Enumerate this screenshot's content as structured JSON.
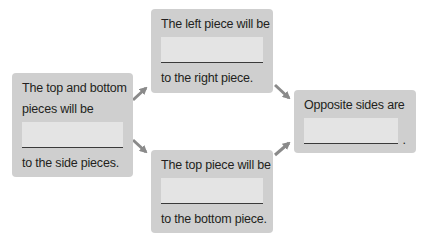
{
  "diagram": {
    "colors": {
      "box_fill": "#cfcfcf",
      "blank_fill": "#e4e4e4",
      "arrow": "#8a8a8a",
      "text": "#231f20"
    },
    "boxes": {
      "left": {
        "line1": "The top and bottom",
        "line2": "pieces will be",
        "blank": "",
        "line3": "to the side pieces."
      },
      "top": {
        "line1": "The left piece will be",
        "blank": "",
        "line2": "to the right piece."
      },
      "bottom": {
        "line1": "The top piece will be",
        "blank": "",
        "line2": "to the bottom piece."
      },
      "right": {
        "line1": "Opposite sides are",
        "blank": "",
        "period": "."
      }
    },
    "arrows": [
      {
        "from": "left",
        "to": "top"
      },
      {
        "from": "left",
        "to": "bottom"
      },
      {
        "from": "top",
        "to": "right"
      },
      {
        "from": "bottom",
        "to": "right"
      }
    ]
  }
}
